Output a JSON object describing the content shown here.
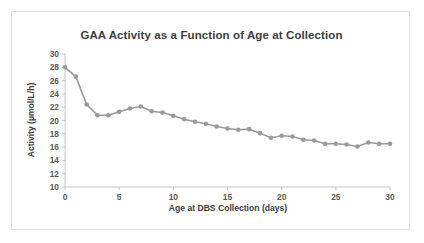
{
  "chart_data": {
    "type": "line",
    "title": "GAA Activity as a Function of Age at Collection",
    "xlabel": "Age at DBS Collection (days)",
    "ylabel": "Activity (µmol/L/h)",
    "xlim": [
      0,
      30
    ],
    "ylim": [
      10,
      30
    ],
    "xticks": [
      0,
      5,
      10,
      15,
      20,
      25,
      30
    ],
    "yticks": [
      10,
      12,
      14,
      16,
      18,
      20,
      22,
      24,
      26,
      28,
      30
    ],
    "xtick_labels": [
      "0",
      "5",
      "10",
      "15",
      "20",
      "25",
      "30"
    ],
    "ytick_labels": [
      "10",
      "12",
      "14",
      "16",
      "18",
      "20",
      "22",
      "24",
      "26",
      "28",
      "30"
    ],
    "grid": false,
    "legend": false,
    "marker": "circle",
    "series_color": "#9a9a9a",
    "x": [
      0,
      1,
      2,
      3,
      4,
      5,
      6,
      7,
      8,
      9,
      10,
      11,
      12,
      13,
      14,
      15,
      16,
      17,
      18,
      19,
      20,
      21,
      22,
      23,
      24,
      25,
      26,
      27,
      28,
      29,
      30
    ],
    "values": [
      28.0,
      26.6,
      22.4,
      20.8,
      20.8,
      21.3,
      21.8,
      22.1,
      21.4,
      21.2,
      20.7,
      20.2,
      19.8,
      19.5,
      19.1,
      18.8,
      18.6,
      18.7,
      18.1,
      17.4,
      17.7,
      17.6,
      17.1,
      17.0,
      16.5,
      16.5,
      16.4,
      16.1,
      16.7,
      16.5,
      16.5
    ]
  },
  "axis_labels": {
    "x_title": "Age at DBS Collection (days)",
    "y_title": "Activity (µmol/L/h)"
  }
}
